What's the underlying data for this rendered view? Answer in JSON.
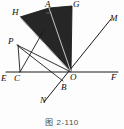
{
  "figure": {
    "caption": "图 2-110",
    "caption_number": "2-110",
    "background_color": "#fdfdfd",
    "stroke_color": "#1a1a1a",
    "fill_color": "#262626",
    "label_color": "#0d0d0d"
  },
  "points": [
    {
      "id": "H",
      "label": "H",
      "x": 20,
      "y": 17,
      "label_x": 12,
      "label_y": 9
    },
    {
      "id": "A",
      "label": "A",
      "x": 49,
      "y": 8,
      "label_x": 46,
      "label_y": 0
    },
    {
      "id": "G",
      "label": "G",
      "x": 72,
      "y": 6,
      "label_x": 73,
      "label_y": 0
    },
    {
      "id": "M",
      "label": "M",
      "x": 110,
      "y": 20,
      "label_x": 110,
      "label_y": 15
    },
    {
      "id": "P",
      "label": "P",
      "x": 17,
      "y": 44,
      "label_x": 9,
      "label_y": 38
    },
    {
      "id": "E",
      "label": "E",
      "x": 8,
      "y": 72,
      "label_x": 2,
      "label_y": 74
    },
    {
      "id": "C",
      "label": "C",
      "x": 20,
      "y": 72,
      "label_x": 15,
      "label_y": 74
    },
    {
      "id": "O",
      "label": "O",
      "x": 71,
      "y": 72,
      "label_x": 71,
      "label_y": 73
    },
    {
      "id": "F",
      "label": "F",
      "x": 116,
      "y": 72,
      "label_x": 112,
      "label_y": 74
    },
    {
      "id": "B",
      "label": "B",
      "x": 63,
      "y": 82,
      "label_x": 62,
      "label_y": 83
    },
    {
      "id": "N",
      "label": "N",
      "x": 45,
      "y": 101,
      "label_x": 41,
      "label_y": 97
    }
  ],
  "shaded_polygon": {
    "name": "quadrilateral-HAGO",
    "vertices": "H,A,G,O",
    "fill": "#262626"
  },
  "segments": [
    {
      "name": "line-EF",
      "from": "E",
      "to": "F",
      "kind": "baseline"
    },
    {
      "name": "line-NM",
      "from": "N",
      "to": "M",
      "kind": "ray"
    },
    {
      "name": "segment-HA",
      "from": "H",
      "to": "A",
      "kind": "edge"
    },
    {
      "name": "segment-AG",
      "from": "A",
      "to": "G",
      "kind": "edge"
    },
    {
      "name": "segment-GO",
      "from": "G",
      "to": "O",
      "kind": "edge"
    },
    {
      "name": "segment-OH",
      "from": "O",
      "to": "H",
      "kind": "edge"
    },
    {
      "name": "segment-AO",
      "from": "A",
      "to": "O",
      "kind": "inner"
    },
    {
      "name": "segment-PO",
      "from": "P",
      "to": "O",
      "kind": "inner"
    },
    {
      "name": "segment-PC",
      "from": "P",
      "to": "C",
      "kind": "inner"
    },
    {
      "name": "segment-CA",
      "from": "C",
      "to": "A",
      "kind": "inner"
    },
    {
      "name": "segment-PB",
      "from": "P",
      "to": "B",
      "kind": "inner"
    }
  ]
}
